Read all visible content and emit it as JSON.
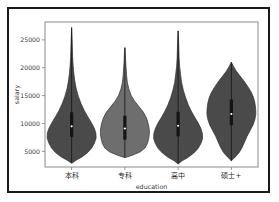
{
  "chart_data": {
    "type": "violin",
    "title": "",
    "xlabel": "education",
    "ylabel": "salary",
    "categories": [
      "本科",
      "专科",
      "高中",
      "硕士+"
    ],
    "ytick_labels": [
      "5000",
      "10000",
      "15000",
      "20000",
      "25000"
    ],
    "ytick_values": [
      5000,
      10000,
      15000,
      20000,
      25000
    ],
    "ylim": [
      2200,
      28200
    ],
    "grid": false,
    "legend": "none",
    "colors": {
      "violin_dark": "#4a4a4a",
      "violin_light": "#6e6e6e",
      "axes_border": "#8a8a8a",
      "figure_border": "#1a1a1a",
      "background": "#ffffff",
      "box": "#141414",
      "median_marker": "#ffffff"
    },
    "series": [
      {
        "name": "本科",
        "color": "#4a4a4a",
        "min": 2900,
        "max": 27200,
        "q1": 7600,
        "median": 9500,
        "q3": 12000,
        "density": [
          [
            2900,
            0.02
          ],
          [
            3400,
            0.18
          ],
          [
            4000,
            0.42
          ],
          [
            4800,
            0.66
          ],
          [
            5600,
            0.82
          ],
          [
            6500,
            0.93
          ],
          [
            7400,
            1.0
          ],
          [
            8300,
            0.99
          ],
          [
            9200,
            0.92
          ],
          [
            10200,
            0.8
          ],
          [
            11200,
            0.66
          ],
          [
            12300,
            0.52
          ],
          [
            13500,
            0.39
          ],
          [
            14800,
            0.28
          ],
          [
            16200,
            0.19
          ],
          [
            17600,
            0.13
          ],
          [
            19000,
            0.09
          ],
          [
            20500,
            0.06
          ],
          [
            22000,
            0.04
          ],
          [
            23500,
            0.03
          ],
          [
            25000,
            0.02
          ],
          [
            26200,
            0.01
          ],
          [
            27200,
            0.0
          ]
        ]
      },
      {
        "name": "专科",
        "color": "#6e6e6e",
        "min": 3900,
        "max": 23600,
        "q1": 7100,
        "median": 9100,
        "q3": 11400,
        "density": [
          [
            3900,
            0.02
          ],
          [
            4300,
            0.3
          ],
          [
            4900,
            0.62
          ],
          [
            5600,
            0.82
          ],
          [
            6400,
            0.92
          ],
          [
            7300,
            0.97
          ],
          [
            8200,
            1.0
          ],
          [
            9100,
            0.99
          ],
          [
            10000,
            0.95
          ],
          [
            11000,
            0.88
          ],
          [
            12000,
            0.76
          ],
          [
            13000,
            0.58
          ],
          [
            14000,
            0.4
          ],
          [
            15000,
            0.26
          ],
          [
            16200,
            0.16
          ],
          [
            17400,
            0.1
          ],
          [
            18600,
            0.07
          ],
          [
            19900,
            0.05
          ],
          [
            21200,
            0.03
          ],
          [
            22400,
            0.02
          ],
          [
            23600,
            0.0
          ]
        ]
      },
      {
        "name": "高中",
        "color": "#4a4a4a",
        "min": 2800,
        "max": 26600,
        "q1": 7700,
        "median": 9600,
        "q3": 12100,
        "density": [
          [
            2800,
            0.02
          ],
          [
            3300,
            0.16
          ],
          [
            3900,
            0.4
          ],
          [
            4700,
            0.64
          ],
          [
            5500,
            0.81
          ],
          [
            6400,
            0.93
          ],
          [
            7300,
            1.0
          ],
          [
            8200,
            0.99
          ],
          [
            9100,
            0.93
          ],
          [
            10100,
            0.82
          ],
          [
            11100,
            0.68
          ],
          [
            12200,
            0.54
          ],
          [
            13400,
            0.41
          ],
          [
            14700,
            0.3
          ],
          [
            16000,
            0.21
          ],
          [
            17400,
            0.14
          ],
          [
            18800,
            0.1
          ],
          [
            20300,
            0.06
          ],
          [
            21800,
            0.04
          ],
          [
            23300,
            0.03
          ],
          [
            24800,
            0.02
          ],
          [
            25800,
            0.01
          ],
          [
            26600,
            0.0
          ]
        ]
      },
      {
        "name": "硕士+",
        "color": "#4a4a4a",
        "min": 3300,
        "max": 21000,
        "q1": 9700,
        "median": 11700,
        "q3": 14300,
        "density": [
          [
            3300,
            0.0
          ],
          [
            4000,
            0.16
          ],
          [
            4800,
            0.32
          ],
          [
            5700,
            0.44
          ],
          [
            6700,
            0.54
          ],
          [
            7700,
            0.64
          ],
          [
            8700,
            0.76
          ],
          [
            9700,
            0.88
          ],
          [
            10700,
            0.96
          ],
          [
            11700,
            1.0
          ],
          [
            12700,
            0.99
          ],
          [
            13700,
            0.96
          ],
          [
            14700,
            0.9
          ],
          [
            15700,
            0.8
          ],
          [
            16700,
            0.66
          ],
          [
            17700,
            0.5
          ],
          [
            18600,
            0.34
          ],
          [
            19400,
            0.2
          ],
          [
            20200,
            0.09
          ],
          [
            21000,
            0.0
          ]
        ]
      }
    ]
  }
}
